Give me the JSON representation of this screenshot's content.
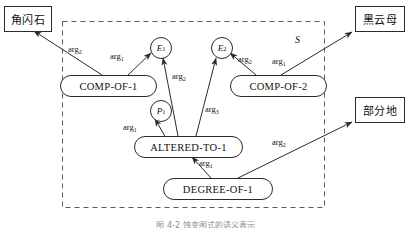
{
  "figure": {
    "scope_label": "S",
    "caption": "图 4-2  蚀变图式的语义表示"
  },
  "entity_boxes": [
    {
      "name": "entity-box-hornblende",
      "text": "角闪石",
      "x": 4,
      "y": 6,
      "w": 46,
      "h": 24
    },
    {
      "name": "entity-box-biotite",
      "text": "黑云母",
      "x": 355,
      "y": 6,
      "w": 48,
      "h": 24
    },
    {
      "name": "entity-box-partially",
      "text": "部分地",
      "x": 355,
      "y": 97,
      "w": 48,
      "h": 24
    }
  ],
  "variables": [
    {
      "name": "variable-e1",
      "label": "E",
      "sub": "1",
      "cx": 160,
      "cy": 47,
      "r": 10
    },
    {
      "name": "variable-e2",
      "label": "E",
      "sub": "2",
      "cx": 221,
      "cy": 47,
      "r": 10
    },
    {
      "name": "variable-p1",
      "label": "P",
      "sub": "1",
      "cx": 160,
      "cy": 110,
      "r": 10
    }
  ],
  "predicates": [
    {
      "name": "predicate-comp-of-1",
      "text": "COMP-OF-1",
      "x": 60,
      "y": 75,
      "w": 95,
      "h": 20
    },
    {
      "name": "predicate-comp-of-2",
      "text": "COMP-OF-2",
      "x": 230,
      "y": 75,
      "w": 95,
      "h": 20
    },
    {
      "name": "predicate-altered-to-1",
      "text": "ALTERED-TO-1",
      "x": 134,
      "y": 136,
      "w": 107,
      "h": 20
    },
    {
      "name": "predicate-degree-of-1",
      "text": "DEGREE-OF-1",
      "x": 163,
      "y": 178,
      "w": 108,
      "h": 20
    }
  ],
  "arg_labels": [
    {
      "name": "arg-label-compof1-hornblende",
      "base": "arg",
      "sub": "2",
      "x": 68,
      "y": 44
    },
    {
      "name": "arg-label-compof1-e1",
      "base": "arg",
      "sub": "1",
      "x": 110,
      "y": 51
    },
    {
      "name": "arg-label-alteredto1-e1",
      "base": "arg",
      "sub": "2",
      "x": 172,
      "y": 71
    },
    {
      "name": "arg-label-compof2-e2",
      "base": "arg",
      "sub": "2",
      "x": 238,
      "y": 54
    },
    {
      "name": "arg-label-compof2-biotite",
      "base": "arg",
      "sub": "1",
      "x": 272,
      "y": 56
    },
    {
      "name": "arg-label-alteredto1-e2",
      "base": "arg",
      "sub": "3",
      "x": 205,
      "y": 104
    },
    {
      "name": "arg-label-alteredto1-p1",
      "base": "arg",
      "sub": "1",
      "x": 123,
      "y": 122
    },
    {
      "name": "arg-label-degreeof1-alteredto",
      "base": "arg",
      "sub": "1",
      "x": 199,
      "y": 158
    },
    {
      "name": "arg-label-degreeof1-partially",
      "base": "arg",
      "sub": "2",
      "x": 272,
      "y": 137
    }
  ],
  "scope_box": {
    "x": 62,
    "y": 21,
    "w": 263,
    "h": 187
  },
  "colors": {
    "stroke": "#2b2b2b",
    "background": "#ffffff",
    "caption": "#8d8d8d"
  }
}
